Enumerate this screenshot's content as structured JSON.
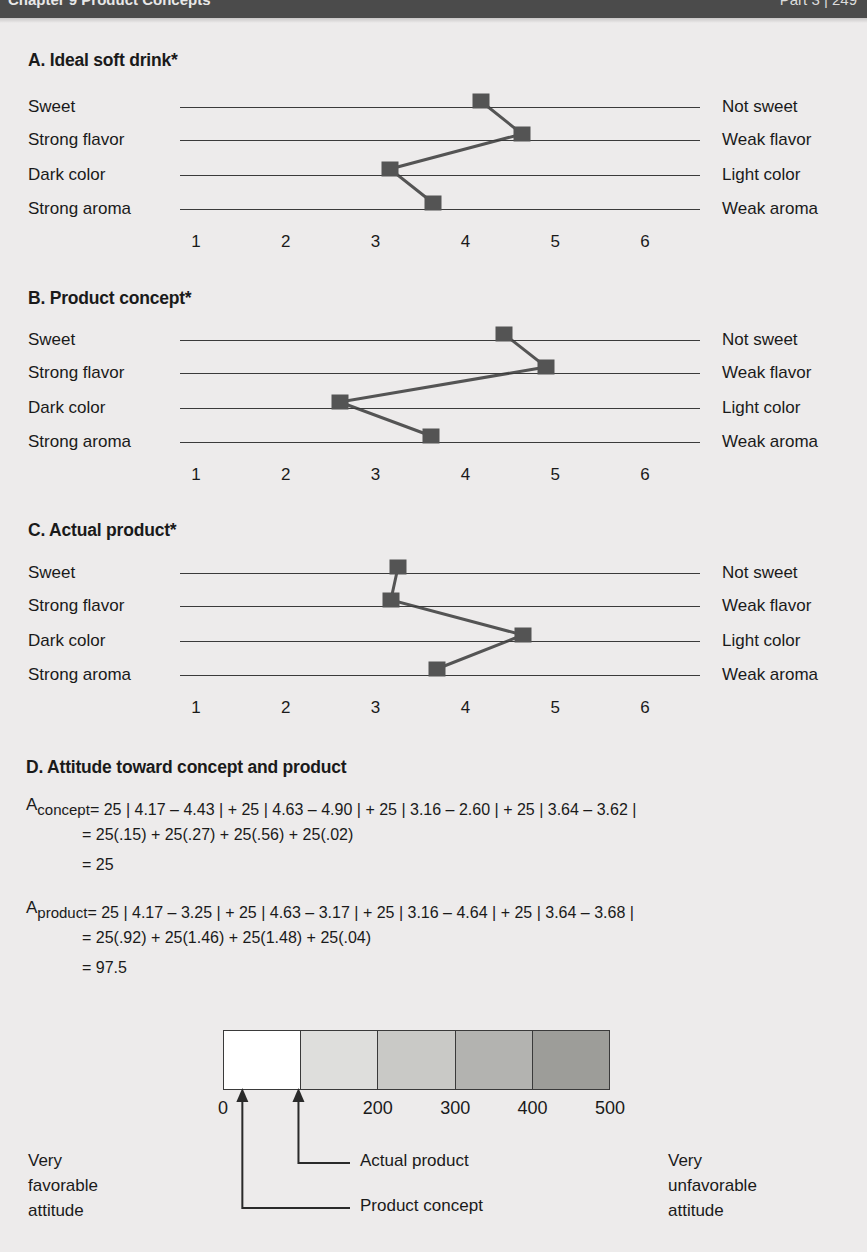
{
  "header": {
    "left_text": "Chapter 9  Product Concepts",
    "right_text": "Part 3   |   249"
  },
  "panels": [
    {
      "id": "A",
      "title": "A. Ideal soft drink*",
      "rows": [
        {
          "left": "Sweet",
          "right": "Not sweet",
          "value": 4.17
        },
        {
          "left": "Strong flavor",
          "right": "Weak flavor",
          "value": 4.63
        },
        {
          "left": "Dark color",
          "right": "Light color",
          "value": 3.16
        },
        {
          "left": "Strong aroma",
          "right": "Weak aroma",
          "value": 3.64
        }
      ],
      "axis_ticks": [
        "1",
        "2",
        "3",
        "4",
        "5",
        "6"
      ]
    },
    {
      "id": "B",
      "title": "B. Product concept*",
      "rows": [
        {
          "left": "Sweet",
          "right": "Not sweet",
          "value": 4.43
        },
        {
          "left": "Strong flavor",
          "right": "Weak flavor",
          "value": 4.9
        },
        {
          "left": "Dark color",
          "right": "Light color",
          "value": 2.6
        },
        {
          "left": "Strong aroma",
          "right": "Weak aroma",
          "value": 3.62
        }
      ],
      "axis_ticks": [
        "1",
        "2",
        "3",
        "4",
        "5",
        "6"
      ]
    },
    {
      "id": "C",
      "title": "C. Actual product*",
      "rows": [
        {
          "left": "Sweet",
          "right": "Not sweet",
          "value": 3.25
        },
        {
          "left": "Strong flavor",
          "right": "Weak flavor",
          "value": 3.17
        },
        {
          "left": "Dark color",
          "right": "Light color",
          "value": 4.64
        },
        {
          "left": "Strong aroma",
          "right": "Weak aroma",
          "value": 3.68
        }
      ],
      "axis_ticks": [
        "1",
        "2",
        "3",
        "4",
        "5",
        "6"
      ]
    }
  ],
  "section_d": {
    "title": "D. Attitude toward concept and product",
    "formulas": [
      {
        "symbol": "A",
        "subscript": "concept",
        "line1": "= 25 | 4.17 – 4.43 | + 25 | 4.63 – 4.90 | + 25 | 3.16 – 2.60 | + 25 | 3.64 – 3.62 |",
        "line2": "= 25(.15) + 25(.27) + 25(.56) + 25(.02)",
        "line3": "= 25"
      },
      {
        "symbol": "A",
        "subscript": "product",
        "line1": "= 25 | 4.17 – 3.25 | + 25 | 4.63 – 3.17 | + 25 | 3.16 – 4.64 | + 25 | 3.64 – 3.68 |",
        "line2": "= 25(.92) + 25(1.46) + 25(1.48) + 25(.04)",
        "line3": "= 97.5"
      }
    ],
    "scale": {
      "ticks": [
        "0",
        "200",
        "300",
        "400",
        "500"
      ],
      "tick_values": [
        0,
        200,
        300,
        400,
        500
      ],
      "min": 0,
      "max": 500,
      "segment_colors": [
        "#ffffff",
        "#dededc",
        "#c9c9c6",
        "#b3b3b0",
        "#9d9d99"
      ],
      "left_caption": "Very\nfavorable\nattitude",
      "right_caption": "Very\nunfavorable\nattitude",
      "markers": [
        {
          "label": "Actual product",
          "value": 97.5
        },
        {
          "label": "Product concept",
          "value": 25
        }
      ]
    }
  },
  "chart_data": {
    "type": "line",
    "xlabel": "",
    "ylabel": "",
    "xlim": [
      1,
      6
    ],
    "x_ticks": [
      1,
      2,
      3,
      4,
      5,
      6
    ],
    "grid": false,
    "legend": "none",
    "categories": [
      "Sweet",
      "Strong flavor",
      "Dark color",
      "Strong aroma"
    ],
    "category_right_anchors": [
      "Not sweet",
      "Weak flavor",
      "Light color",
      "Weak aroma"
    ],
    "series": [
      {
        "name": "A. Ideal soft drink",
        "values": [
          4.17,
          4.63,
          3.16,
          3.64
        ]
      },
      {
        "name": "B. Product concept",
        "values": [
          4.43,
          4.9,
          2.6,
          3.62
        ]
      },
      {
        "name": "C. Actual product",
        "values": [
          3.25,
          3.17,
          4.64,
          3.68
        ]
      }
    ],
    "attitude_scale": {
      "type": "bar",
      "xlim": [
        0,
        500
      ],
      "ticks": [
        0,
        200,
        300,
        400,
        500
      ],
      "points": [
        {
          "name": "Product concept",
          "value": 25
        },
        {
          "name": "Actual product",
          "value": 97.5
        }
      ]
    }
  }
}
